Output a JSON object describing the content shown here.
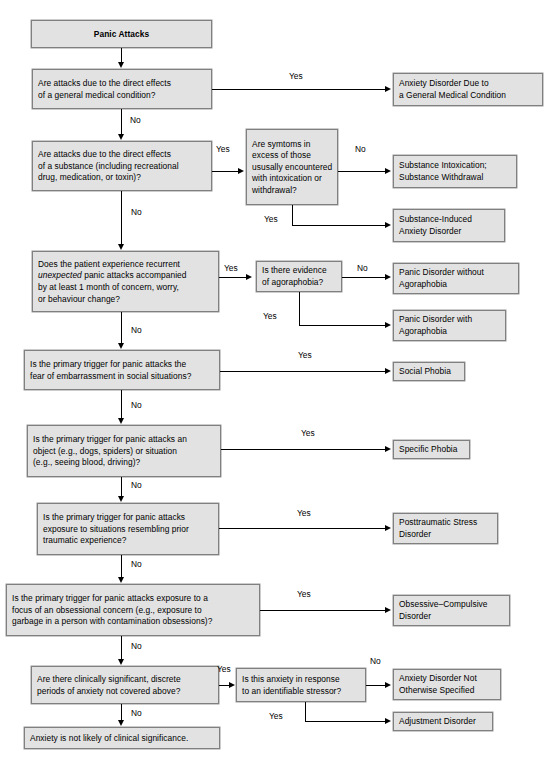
{
  "diagram": {
    "colors": {
      "box_fill": "#e2e2e2",
      "box_border": "#808080",
      "line": "#000000",
      "text": "#000000",
      "background": "#ffffff"
    }
  },
  "nodes": {
    "start": {
      "id": "panic-attacks",
      "kind": "start",
      "lines": [
        "Panic Attacks"
      ]
    },
    "q_medical": {
      "id": "question-general-medical-condition",
      "kind": "question",
      "lines": [
        "Are attacks due to the direct effects",
        "of a general medical condition?"
      ]
    },
    "q_substance": {
      "id": "question-substance-effects",
      "kind": "question",
      "lines": [
        "Are attacks due to the direct effects",
        "of a substance (including recreational",
        "drug, medication, or toxin)?"
      ]
    },
    "q_excess": {
      "id": "question-symptoms-in-excess",
      "kind": "question",
      "lines": [
        "Are symtoms in",
        "excess of those",
        "ususally encountered",
        "with intoxication or",
        "withdrawal?"
      ]
    },
    "q_unexpected": {
      "id": "question-recurrent-unexpected-attacks",
      "kind": "question",
      "lines": [
        "Does the patient experience recurrent",
        "unexpected panic attacks accompanied",
        "by at least 1 month of concern, worry,",
        "or behaviour change?"
      ],
      "italic_word": "unexpected"
    },
    "q_agoraphobia": {
      "id": "question-evidence-of-agoraphobia",
      "kind": "question",
      "lines": [
        "Is there evidence",
        "of agoraphobia?"
      ]
    },
    "q_social": {
      "id": "question-fear-of-embarrassment",
      "kind": "question",
      "lines": [
        "Is the primary trigger for panic attacks the",
        "fear of embarrassment in social situations?"
      ]
    },
    "q_specific": {
      "id": "question-object-or-situation-trigger",
      "kind": "question",
      "lines": [
        "Is the primary trigger for panic attacks an",
        "object (e.g., dogs, spiders) or situation",
        "(e.g., seeing blood, driving)?"
      ]
    },
    "q_ptsd": {
      "id": "question-prior-traumatic-experience",
      "kind": "question",
      "lines": [
        "Is the primary trigger for panic attacks",
        "exposure to situations resembling prior",
        "traumatic experience?"
      ]
    },
    "q_ocd": {
      "id": "question-obsessional-concern",
      "kind": "question",
      "lines": [
        "Is the primary trigger for panic attacks exposure to a",
        "focus of an obsessional concern (e.g., exposure to",
        "garbage in a person with contamination obsessions)?"
      ]
    },
    "q_discrete": {
      "id": "question-discrete-periods-of-anxiety",
      "kind": "question",
      "lines": [
        "Are there clinically significant, discrete",
        "periods of anxiety not covered above?"
      ]
    },
    "q_stressor": {
      "id": "question-identifiable-stressor",
      "kind": "question",
      "lines": [
        "Is this anxiety in response",
        "to an identifiable stressor?"
      ]
    },
    "out_gmc": {
      "id": "outcome-anxiety-disorder-gmc",
      "kind": "outcome",
      "lines": [
        "Anxiety Disorder Due to",
        "a General Medical Condition"
      ]
    },
    "out_intox": {
      "id": "outcome-substance-intoxication-withdrawal",
      "kind": "outcome",
      "lines": [
        "Substance Intoxication;",
        "Substance Withdrawal"
      ]
    },
    "out_sub_induced": {
      "id": "outcome-substance-induced-anxiety-disorder",
      "kind": "outcome",
      "lines": [
        "Substance-Induced",
        "Anxiety Disorder"
      ]
    },
    "out_pd_without": {
      "id": "outcome-panic-disorder-without-agoraphobia",
      "kind": "outcome",
      "lines": [
        "Panic Disorder without",
        "Agoraphobia"
      ]
    },
    "out_pd_with": {
      "id": "outcome-panic-disorder-with-agoraphobia",
      "kind": "outcome",
      "lines": [
        "Panic Disorder with",
        "Agoraphobia"
      ]
    },
    "out_social": {
      "id": "outcome-social-phobia",
      "kind": "outcome",
      "lines": [
        "Social Phobia"
      ]
    },
    "out_specific": {
      "id": "outcome-specific-phobia",
      "kind": "outcome",
      "lines": [
        "Specific Phobia"
      ]
    },
    "out_ptsd": {
      "id": "outcome-posttraumatic-stress-disorder",
      "kind": "outcome",
      "lines": [
        "Posttraumatic Stress",
        "Disorder"
      ]
    },
    "out_ocd": {
      "id": "outcome-obsessive-compulsive-disorder",
      "kind": "outcome",
      "lines": [
        "Obsessive–Compulsive",
        "Disorder"
      ]
    },
    "out_nos": {
      "id": "outcome-anxiety-disorder-nos",
      "kind": "outcome",
      "lines": [
        "Anxiety Disorder Not",
        "Otherwise Specified"
      ]
    },
    "out_adjustment": {
      "id": "outcome-adjustment-disorder",
      "kind": "outcome",
      "lines": [
        "Adjustment Disorder"
      ]
    },
    "out_none": {
      "id": "outcome-no-clinical-significance",
      "kind": "outcome",
      "lines": [
        "Anxiety is not likely of clinical significance."
      ]
    }
  },
  "edge_labels": {
    "yes_gmc": "Yes",
    "no_gmc": "No",
    "yes_substance": "Yes",
    "no_substance": "No",
    "no_excess": "No",
    "yes_excess": "Yes",
    "yes_unexpected": "Yes",
    "no_unexpected": "No",
    "no_agoraphobia": "No",
    "yes_agoraphobia": "Yes",
    "yes_social": "Yes",
    "no_social": "No",
    "yes_specific": "Yes",
    "no_specific": "No",
    "yes_ptsd": "Yes",
    "no_ptsd": "No",
    "yes_ocd": "Yes",
    "no_ocd": "No",
    "yes_discrete": "Yes",
    "no_discrete": "No",
    "no_stressor": "No",
    "yes_stressor": "Yes"
  }
}
